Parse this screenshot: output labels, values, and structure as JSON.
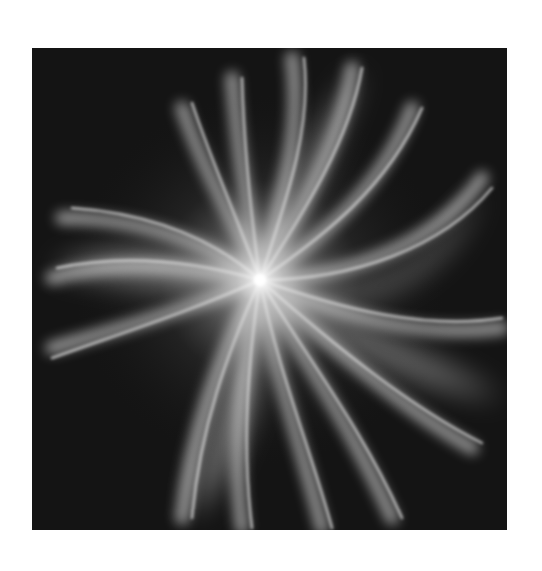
{
  "image": {
    "subject": "abstract swirl of white light rays radiating from a bright center on a dark square",
    "background_color": "#ffffff",
    "panel_color": "#141414",
    "ray_color": "#ffffff",
    "center": {
      "x": 260,
      "y": 280
    },
    "panel": {
      "x": 32,
      "y": 48,
      "width": 475,
      "height": 482
    }
  }
}
